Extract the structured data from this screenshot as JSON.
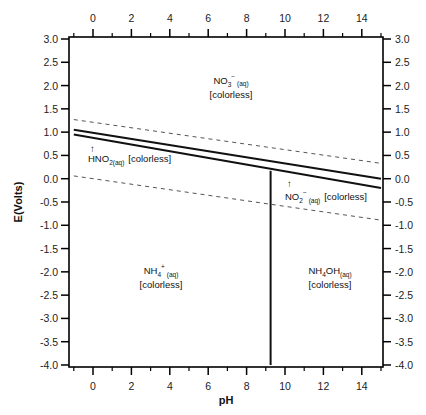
{
  "chart_data": {
    "type": "line",
    "title": "",
    "xlabel": "pH",
    "ylabel": "E(Volts)",
    "xlim": [
      -1,
      15
    ],
    "ylim": [
      -4.0,
      3.0
    ],
    "grid": false,
    "x_ticks": [
      0,
      2,
      4,
      6,
      8,
      10,
      12,
      14
    ],
    "x_minor_ticks": [
      -1,
      1,
      3,
      5,
      7,
      9,
      11,
      13,
      15
    ],
    "y_ticks": [
      3.0,
      2.5,
      2.0,
      1.5,
      1.0,
      0.5,
      0.0,
      -0.5,
      -1.0,
      -1.5,
      -2.0,
      -2.5,
      -3.0,
      -3.5,
      -4.0
    ],
    "y_tick_labels": [
      "3.0",
      "2.5",
      "2.0",
      "1.5",
      "1.0",
      "0.5",
      "0.0",
      "-0.5",
      "-1.0",
      "-1.5",
      "-2.0",
      "-2.5",
      "-3.0",
      "-3.5",
      "-4.0"
    ],
    "mirror_axes": true,
    "series": [
      {
        "name": "NO3-/HNO2 boundary",
        "style": "solid",
        "x": [
          -1,
          15
        ],
        "y": [
          1.05,
          0.0
        ]
      },
      {
        "name": "HNO2/NH4+ boundary",
        "style": "solid",
        "x": [
          -1,
          15
        ],
        "y": [
          0.95,
          -0.2
        ]
      },
      {
        "name": "NH4+/NH4OH boundary",
        "style": "solid",
        "x": [
          9.25,
          9.25
        ],
        "y": [
          0.17,
          -4.0
        ]
      },
      {
        "name": "O2/H2O water line",
        "style": "dashed",
        "x": [
          -1,
          15
        ],
        "y": [
          1.27,
          0.33
        ]
      },
      {
        "name": "H2O/H2 water line",
        "style": "dashed",
        "x": [
          -1,
          15
        ],
        "y": [
          0.06,
          -0.89
        ]
      }
    ],
    "annotations": [
      {
        "species": "NO3",
        "charge": "-",
        "phase": "(aq)",
        "note": "[colorless]",
        "x": 7.8,
        "y": 2.0
      },
      {
        "species": "HNO2",
        "phase": "(aq)",
        "note": "[colorless]",
        "arrow": "up",
        "x": 0.8,
        "y": 0.45
      },
      {
        "species": "NO2",
        "charge": "-",
        "phase": "(aq)",
        "note": "[colorless]",
        "arrow": "up",
        "x": 12.0,
        "y": -0.55
      },
      {
        "species": "NH4",
        "charge": "+",
        "phase": "(aq)",
        "note": "[colorless]",
        "x": 3.6,
        "y": -2.1
      },
      {
        "species": "NH4OH",
        "phase": "(aq)",
        "note": "[colorless]",
        "x": 12.0,
        "y": -2.1
      }
    ]
  },
  "labels": {
    "no3": {
      "main": "NO",
      "sub": "3",
      "sup": "−",
      "phase": "(aq)",
      "note": "[colorless]"
    },
    "hno2": {
      "main": "HNO",
      "sub": "2(aq)",
      "note": "[colorless]",
      "arrow": "↑"
    },
    "no2": {
      "main": "NO",
      "sub": "2",
      "sup": "−",
      "phase": "(aq)",
      "note": "[colorless]",
      "arrow": "↑"
    },
    "nh4": {
      "main": "NH",
      "sub": "4",
      "sup": "+",
      "phase": "(aq)",
      "note": "[colorless]"
    },
    "nh4oh": {
      "main": "NH",
      "sub": "4",
      "main2": "OH",
      "phase": "(aq)",
      "note": "[colorless]"
    }
  },
  "colors": {
    "line": "#111111",
    "dashed": "#555555",
    "frame": "#000000",
    "text": "#222222"
  }
}
